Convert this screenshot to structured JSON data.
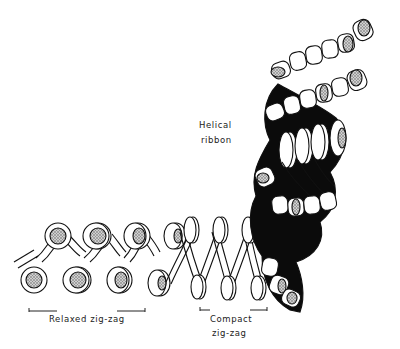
{
  "labels": {
    "helical_line1": "Helical",
    "helical_line2": "ribbon",
    "relaxed": "Relaxed zig-zag",
    "compact_line1": "Compact",
    "compact_line2": "zig-zag"
  },
  "colors": {
    "ink": "#111111",
    "stipple": "#9a9a9a",
    "paper": "#ffffff",
    "shadow": "#0a0a0a"
  }
}
